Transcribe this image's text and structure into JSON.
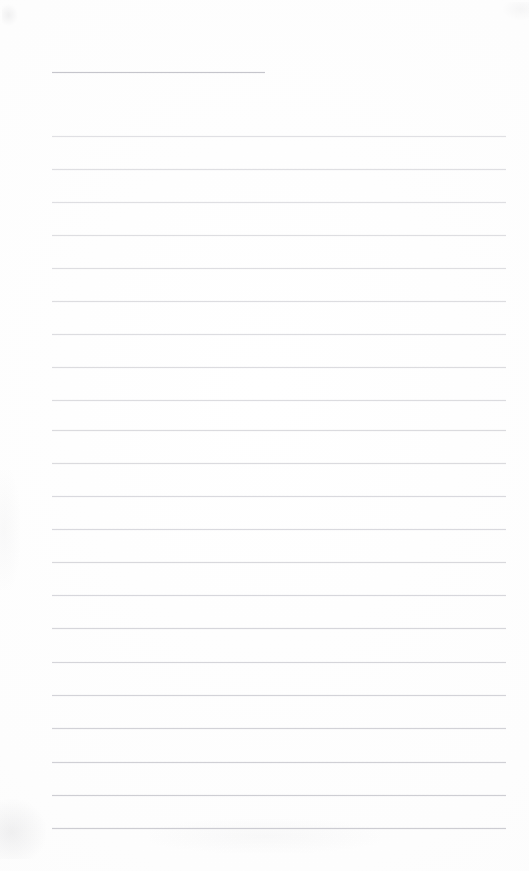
{
  "document": {
    "kind": "scanned-blank-ruled-page",
    "title": "",
    "body_text": "",
    "handwriting": "",
    "printed_text": "",
    "page_number": ""
  },
  "page": {
    "width": 529,
    "height": 871,
    "background_color": "#fefefe",
    "paper_tone": "#fdfdfd"
  },
  "ruling": {
    "line_color": "#c9c9cf",
    "line_thickness_px": 1,
    "line_spacing_px": 33,
    "left_margin_px": 52,
    "right_edge_px": 507,
    "body_line_count": 22,
    "has_vertical_margin_rule": false,
    "header_rule": {
      "y": 72,
      "x_start": 52,
      "x_end": 265,
      "color": "#c4c4ca"
    },
    "body_lines": [
      {
        "y": 136,
        "x_start": 52,
        "x_end": 506,
        "opacity": 0.55
      },
      {
        "y": 169,
        "x_start": 52,
        "x_end": 506,
        "opacity": 0.58
      },
      {
        "y": 202,
        "x_start": 52,
        "x_end": 506,
        "opacity": 0.58
      },
      {
        "y": 235,
        "x_start": 52,
        "x_end": 506,
        "opacity": 0.6
      },
      {
        "y": 268,
        "x_start": 52,
        "x_end": 506,
        "opacity": 0.6
      },
      {
        "y": 301,
        "x_start": 52,
        "x_end": 506,
        "opacity": 0.62
      },
      {
        "y": 334,
        "x_start": 52,
        "x_end": 506,
        "opacity": 0.62
      },
      {
        "y": 367,
        "x_start": 52,
        "x_end": 506,
        "opacity": 0.64
      },
      {
        "y": 400,
        "x_start": 52,
        "x_end": 506,
        "opacity": 0.64
      },
      {
        "y": 430,
        "x_start": 52,
        "x_end": 506,
        "opacity": 0.66
      },
      {
        "y": 463,
        "x_start": 52,
        "x_end": 506,
        "opacity": 0.66
      },
      {
        "y": 496,
        "x_start": 52,
        "x_end": 506,
        "opacity": 0.68
      },
      {
        "y": 529,
        "x_start": 52,
        "x_end": 506,
        "opacity": 0.68
      },
      {
        "y": 562,
        "x_start": 52,
        "x_end": 506,
        "opacity": 0.7
      },
      {
        "y": 595,
        "x_start": 52,
        "x_end": 506,
        "opacity": 0.72
      },
      {
        "y": 628,
        "x_start": 52,
        "x_end": 506,
        "opacity": 0.74
      },
      {
        "y": 662,
        "x_start": 52,
        "x_end": 506,
        "opacity": 0.76
      },
      {
        "y": 695,
        "x_start": 52,
        "x_end": 506,
        "opacity": 0.8
      },
      {
        "y": 728,
        "x_start": 52,
        "x_end": 506,
        "opacity": 0.82
      },
      {
        "y": 762,
        "x_start": 52,
        "x_end": 506,
        "opacity": 0.86
      },
      {
        "y": 795,
        "x_start": 52,
        "x_end": 506,
        "opacity": 0.9
      },
      {
        "y": 828,
        "x_start": 52,
        "x_end": 506,
        "opacity": 0.92
      }
    ]
  },
  "artifacts": [
    {
      "name": "scan-smudge-top-left",
      "x": 2,
      "y": 4,
      "width": 16,
      "height": 22
    },
    {
      "name": "scan-smudge-top-right",
      "x": 503,
      "y": 2,
      "width": 26,
      "height": 18
    },
    {
      "name": "scan-smudge-bottom-left",
      "x": 0,
      "y": 799,
      "width": 46,
      "height": 60
    },
    {
      "name": "scan-smudge-bottom-center",
      "x": 150,
      "y": 819,
      "width": 230,
      "height": 34
    },
    {
      "name": "scan-smudge-mid-left",
      "x": 0,
      "y": 470,
      "width": 20,
      "height": 120
    }
  ]
}
